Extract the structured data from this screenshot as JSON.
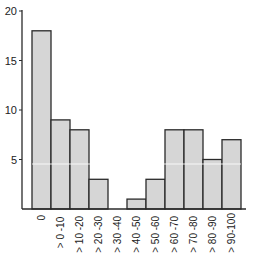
{
  "chart_data": {
    "type": "bar",
    "title": "",
    "xlabel": "",
    "ylabel": "",
    "categories": [
      "0",
      "> 0 -10",
      "> 10 -20",
      "> 20 -30",
      "> 30 -40",
      "> 40 -50",
      "> 50 -60",
      "> 60 -70",
      "> 70 -80",
      "> 80 -90",
      "> 90-100"
    ],
    "values": [
      18,
      9,
      8,
      3,
      0,
      1,
      3,
      8,
      8,
      5,
      7
    ],
    "ylim": [
      0,
      20
    ],
    "yticks": [
      5,
      10,
      15,
      20
    ],
    "ytick_labels": [
      "5",
      "10",
      "15",
      "20"
    ],
    "grid": false,
    "legend": null,
    "bar_color": "#d6d6d6",
    "edge_color": "#2a2a2a"
  }
}
